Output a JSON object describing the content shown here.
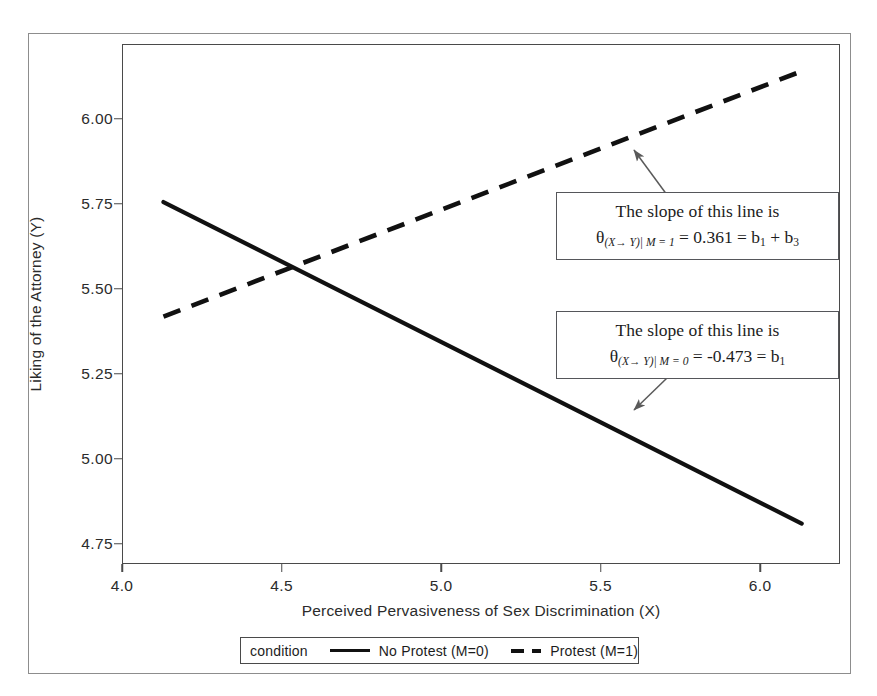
{
  "chart_data": {
    "type": "line",
    "title": "",
    "xlabel": "Perceived Pervasiveness of Sex Discrimination (X)",
    "ylabel": "Liking of the Attorney (Y)",
    "xlim": [
      4.0,
      6.25
    ],
    "ylim": [
      4.69,
      6.22
    ],
    "xticks": [
      "4.0",
      "4.5",
      "5.0",
      "5.5",
      "6.0"
    ],
    "xtick_values": [
      4.0,
      4.5,
      5.0,
      5.5,
      6.0
    ],
    "yticks": [
      "4.75",
      "5.00",
      "5.25",
      "5.50",
      "5.75",
      "6.00"
    ],
    "ytick_values": [
      4.75,
      5.0,
      5.25,
      5.5,
      5.75,
      6.0
    ],
    "grid": false,
    "legend_position": "bottom",
    "legend_title": "condition",
    "series": [
      {
        "name": "No Protest (M=0)",
        "style": "solid",
        "color": "#111111",
        "x": [
          4.13,
          6.13
        ],
        "y": [
          5.755,
          5.809
        ],
        "y_end": 4.809,
        "slope": -0.473,
        "points": [
          [
            4.13,
            5.755
          ],
          [
            6.13,
            4.809
          ]
        ]
      },
      {
        "name": "Protest (M=1)",
        "style": "dashed",
        "color": "#111111",
        "x": [
          4.13,
          6.13
        ],
        "slope": 0.361,
        "points": [
          [
            4.13,
            5.418
          ],
          [
            6.13,
            6.14
          ]
        ]
      }
    ],
    "annotations": [
      {
        "id": "protest-slope",
        "line1": "The slope of this line is",
        "theta": "θ",
        "sub": "(X→ Y)| M = 1",
        "equation": " = 0.361 = b",
        "b_sub_1": "1",
        "plus": " + b",
        "b_sub_2": "3",
        "target_series": "Protest (M=1)",
        "value": 0.361
      },
      {
        "id": "no-protest-slope",
        "line1": "The slope of this line is",
        "theta": "θ",
        "sub": "(X→ Y)| M = 0",
        "equation": " = -0.473 = b",
        "b_sub_1": "1",
        "target_series": "No Protest (M=0)",
        "value": -0.473
      }
    ]
  },
  "legend": {
    "title": "condition",
    "items": [
      {
        "label": "No Protest (M=0)",
        "style": "solid"
      },
      {
        "label": "Protest (M=1)",
        "style": "dashed"
      }
    ]
  },
  "axes": {
    "x_title": "Perceived Pervasiveness of Sex Discrimination (X)",
    "y_title": "Liking of the Attorney (Y)",
    "x_ticks": [
      "4.0",
      "4.5",
      "5.0",
      "5.5",
      "6.0"
    ],
    "y_ticks": [
      "6.00",
      "5.75",
      "5.50",
      "5.25",
      "5.00",
      "4.75"
    ]
  }
}
